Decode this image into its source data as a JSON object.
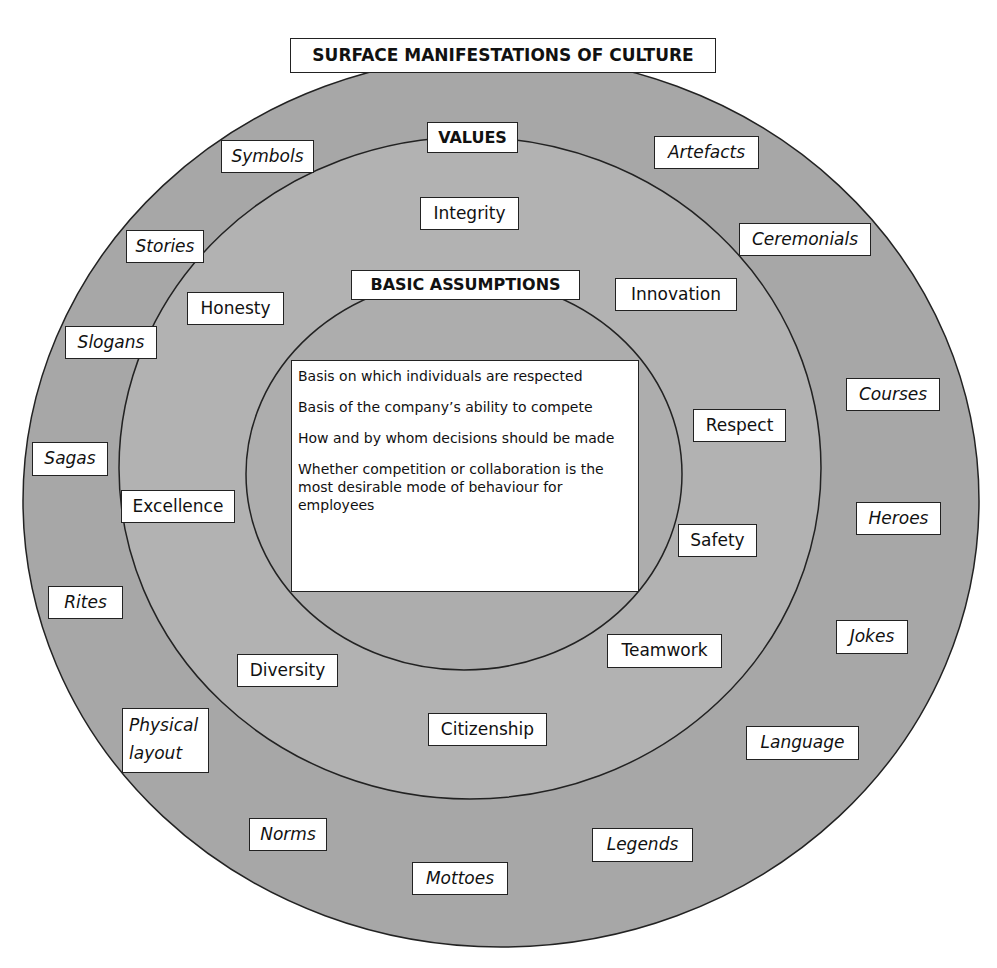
{
  "colors": {
    "outer_ring": "#a7a7a7",
    "middle_ring": "#b2b2b2",
    "inner_ring": "#adadad",
    "outline": "#222222",
    "label_bg": "#ffffff"
  },
  "title": "SURFACE MANIFESTATIONS OF CULTURE",
  "values": {
    "heading": "VALUES",
    "items": [
      "Integrity",
      "Honesty",
      "Innovation",
      "Respect",
      "Excellence",
      "Safety",
      "Diversity",
      "Teamwork",
      "Citizenship"
    ]
  },
  "basic_assumptions": {
    "heading": "BASIC ASSUMPTIONS",
    "items": [
      "Basis on which individuals are respected",
      "Basis of the company’s ability to compete",
      "How and by whom decisions should be made",
      "Whether competition or collaboration is the most desirable mode of behaviour for employees"
    ]
  },
  "surface_manifestations": {
    "items": [
      "Symbols",
      "Artefacts",
      "Stories",
      "Ceremonials",
      "Slogans",
      "Courses",
      "Sagas",
      "Heroes",
      "Rites",
      "Jokes",
      "Physical layout",
      "Language",
      "Norms",
      "Legends",
      "Mottoes"
    ]
  }
}
